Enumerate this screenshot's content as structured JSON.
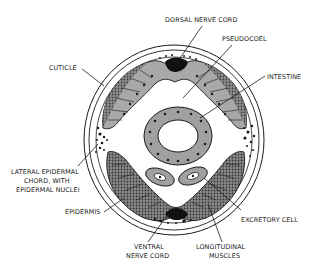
{
  "diagram": {
    "labels": {
      "dorsal_nerve_cord": "DORSAL NERVE CORD",
      "pseudocoel": "PSEUDOCOEL",
      "cuticle": "CUTICLE",
      "intestine": "INTESTINE",
      "lateral_line1": "LATERAL EPIDERMAL",
      "lateral_line2": "CHORD, WITH",
      "lateral_line3": "EPIDERMAL NUCLEI",
      "epidermis": "EPIDERMIS",
      "excretory_cell": "EXCRETORY CELL",
      "ventral_line1": "VENTRAL",
      "ventral_line2": "NERVE CORD",
      "longitudinal_line1": "LONGITUDINAL",
      "longitudinal_line2": "MUSCLES"
    },
    "colors": {
      "outline": "#1a1a1a",
      "muscle_fill": "#a8a8a8",
      "muscle_dark": "#555555",
      "intestine_fill": "#a0a0a0",
      "background": "#ffffff"
    }
  }
}
